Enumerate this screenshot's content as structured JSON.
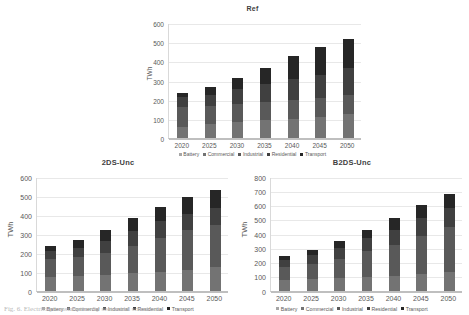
{
  "figure": {
    "caption": "Fig. 6. Electricity consumption by sector and scenario",
    "ylabel": "TWh",
    "series_order": [
      "Battery",
      "Commercial",
      "Industrial",
      "Residential",
      "Transport"
    ],
    "colors": {
      "Battery": "#a6a6a6",
      "Commercial": "#737373",
      "Industrial": "#595959",
      "Residential": "#404040",
      "Transport": "#262626"
    }
  },
  "legend": {
    "items": [
      {
        "label": "Battery",
        "color": "#a6a6a6"
      },
      {
        "label": "Commercial",
        "color": "#737373"
      },
      {
        "label": "Industrial",
        "color": "#595959"
      },
      {
        "label": "Residential",
        "color": "#404040"
      },
      {
        "label": "Transport",
        "color": "#262626"
      }
    ]
  },
  "chart_data": [
    {
      "type": "bar",
      "id": "ref",
      "title": "Ref",
      "xlabel": "",
      "ylabel": "TWh",
      "ylim": [
        0,
        600
      ],
      "yticks": [
        0,
        100,
        200,
        300,
        400,
        500,
        600
      ],
      "grid": true,
      "stacked": true,
      "legend_position": "bottom",
      "categories": [
        "2020",
        "2025",
        "2030",
        "2035",
        "2040",
        "2045",
        "2050"
      ],
      "series": [
        {
          "name": "Battery",
          "values": [
            0,
            0,
            0,
            0,
            0,
            0,
            0
          ]
        },
        {
          "name": "Commercial",
          "values": [
            57,
            74,
            84,
            93,
            101,
            110,
            124
          ]
        },
        {
          "name": "Industrial",
          "values": [
            104,
            91,
            93,
            95,
            97,
            100,
            103
          ]
        },
        {
          "name": "Residential",
          "values": [
            52,
            62,
            77,
            92,
            108,
            121,
            136
          ]
        },
        {
          "name": "Transport",
          "values": [
            20,
            39,
            57,
            88,
            120,
            144,
            155
          ]
        }
      ],
      "totals": [
        233,
        266,
        311,
        368,
        426,
        475,
        518
      ]
    },
    {
      "type": "bar",
      "id": "2ds-unc",
      "title": "2DS-Unc",
      "xlabel": "",
      "ylabel": "TWh",
      "ylim": [
        0,
        600
      ],
      "yticks": [
        0,
        100,
        200,
        300,
        400,
        500,
        600
      ],
      "grid": true,
      "stacked": true,
      "legend_position": "bottom",
      "categories": [
        "2020",
        "2025",
        "2030",
        "2035",
        "2040",
        "2045",
        "2050"
      ],
      "series": [
        {
          "name": "Battery",
          "values": [
            0,
            0,
            0,
            0,
            0,
            0,
            0
          ]
        },
        {
          "name": "Commercial",
          "values": [
            70,
            76,
            82,
            92,
            100,
            110,
            124
          ]
        },
        {
          "name": "Industrial",
          "values": [
            96,
            99,
            115,
            140,
            176,
            208,
            219
          ]
        },
        {
          "name": "Residential",
          "values": [
            43,
            51,
            65,
            82,
            92,
            83,
            92
          ]
        },
        {
          "name": "Transport",
          "values": [
            24,
            42,
            54,
            68,
            71,
            90,
            96
          ]
        }
      ],
      "totals": [
        233,
        268,
        316,
        382,
        439,
        491,
        531
      ]
    },
    {
      "type": "bar",
      "id": "b2ds-unc",
      "title": "B2DS-Unc",
      "xlabel": "",
      "ylabel": "TWh",
      "ylim": [
        0,
        800
      ],
      "yticks": [
        0,
        100,
        200,
        300,
        400,
        500,
        600,
        700,
        800
      ],
      "grid": true,
      "stacked": true,
      "legend_position": "bottom",
      "categories": [
        "2020",
        "2025",
        "2030",
        "2035",
        "2040",
        "2045",
        "2050"
      ],
      "series": [
        {
          "name": "Battery",
          "values": [
            0,
            0,
            0,
            0,
            0,
            0,
            0
          ]
        },
        {
          "name": "Commercial",
          "values": [
            72,
            78,
            86,
            95,
            105,
            118,
            132
          ]
        },
        {
          "name": "Industrial",
          "values": [
            95,
            107,
            137,
            183,
            212,
            263,
            315
          ]
        },
        {
          "name": "Residential",
          "values": [
            47,
            62,
            78,
            88,
            110,
            125,
            135
          ]
        },
        {
          "name": "Transport",
          "values": [
            25,
            40,
            48,
            59,
            84,
            93,
            98
          ]
        }
      ],
      "totals": [
        239,
        287,
        349,
        425,
        511,
        599,
        680
      ]
    }
  ]
}
